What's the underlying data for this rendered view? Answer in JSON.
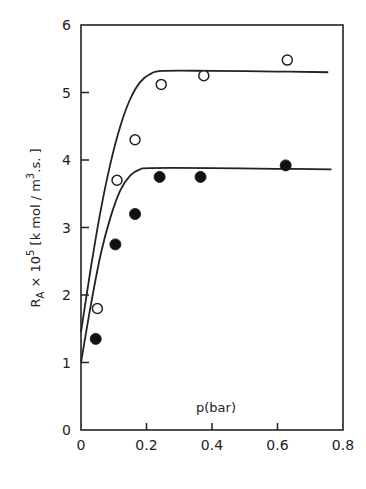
{
  "chart_data": {
    "type": "scatter",
    "title": "",
    "xlabel": "p(bar)",
    "ylabel": "R_A × 10^5 [k mol / m^3.s.]",
    "ylabel_parts": {
      "main": "R",
      "sub": "A",
      "mid": " × 10",
      "sup": "5",
      "rest1": " [k mol / m",
      "sup2": "3",
      "rest2": ".s. ]"
    },
    "xlim": [
      0,
      0.8
    ],
    "ylim": [
      0,
      6
    ],
    "x_ticks": [
      0,
      0.2,
      0.4,
      0.6,
      0.8
    ],
    "x_tick_labels": [
      "0",
      "0.2",
      "0.4",
      "0.6",
      "0.8"
    ],
    "y_ticks": [
      0,
      1,
      2,
      3,
      4,
      5,
      6
    ],
    "y_tick_labels": [
      "0",
      "1",
      "2",
      "3",
      "4",
      "5",
      "6"
    ],
    "grid": false,
    "series": [
      {
        "name": "open-circles",
        "marker": "open-circle",
        "points": [
          {
            "x": 0.05,
            "y": 1.8
          },
          {
            "x": 0.11,
            "y": 3.7
          },
          {
            "x": 0.165,
            "y": 4.3
          },
          {
            "x": 0.245,
            "y": 5.12
          },
          {
            "x": 0.375,
            "y": 5.25
          },
          {
            "x": 0.63,
            "y": 5.48
          }
        ],
        "fit_curve": [
          {
            "x": 0.0,
            "y": 1.45
          },
          {
            "x": 0.03,
            "y": 2.4
          },
          {
            "x": 0.06,
            "y": 3.25
          },
          {
            "x": 0.09,
            "y": 3.95
          },
          {
            "x": 0.12,
            "y": 4.5
          },
          {
            "x": 0.15,
            "y": 4.9
          },
          {
            "x": 0.18,
            "y": 5.15
          },
          {
            "x": 0.21,
            "y": 5.27
          },
          {
            "x": 0.25,
            "y": 5.32
          },
          {
            "x": 0.4,
            "y": 5.32
          },
          {
            "x": 0.6,
            "y": 5.31
          },
          {
            "x": 0.755,
            "y": 5.3
          }
        ]
      },
      {
        "name": "filled-circles",
        "marker": "filled-circle",
        "points": [
          {
            "x": 0.045,
            "y": 1.35
          },
          {
            "x": 0.105,
            "y": 2.75
          },
          {
            "x": 0.165,
            "y": 3.2
          },
          {
            "x": 0.24,
            "y": 3.75
          },
          {
            "x": 0.365,
            "y": 3.75
          },
          {
            "x": 0.625,
            "y": 3.92
          }
        ],
        "fit_curve": [
          {
            "x": 0.0,
            "y": 1.0
          },
          {
            "x": 0.03,
            "y": 1.85
          },
          {
            "x": 0.06,
            "y": 2.6
          },
          {
            "x": 0.09,
            "y": 3.15
          },
          {
            "x": 0.12,
            "y": 3.55
          },
          {
            "x": 0.15,
            "y": 3.77
          },
          {
            "x": 0.18,
            "y": 3.86
          },
          {
            "x": 0.21,
            "y": 3.88
          },
          {
            "x": 0.4,
            "y": 3.88
          },
          {
            "x": 0.6,
            "y": 3.87
          },
          {
            "x": 0.765,
            "y": 3.86
          }
        ]
      }
    ]
  }
}
